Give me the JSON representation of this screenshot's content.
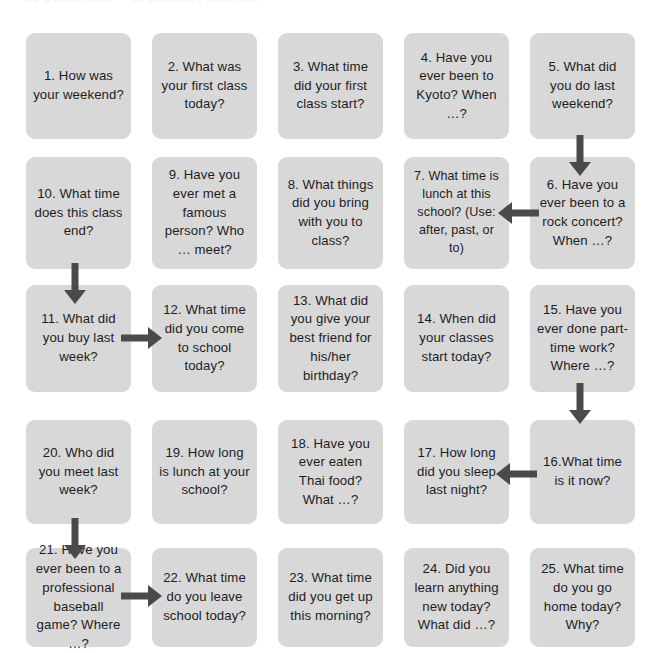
{
  "page": {
    "title_strip": "25 QUESTIONS — SPEAKING PRACTICE",
    "card_color": "#d8d8d8",
    "arrow_color": "#4a4a4a",
    "background": "#ffffff",
    "text_color": "#1d1d1f",
    "grid": {
      "columns": 5,
      "rows": 5,
      "flow": "boustrophedon"
    }
  },
  "cards": [
    {
      "n": "1",
      "text": "1. How was your weekend?"
    },
    {
      "n": "2",
      "text": "2. What was your first class today?"
    },
    {
      "n": "3",
      "text": "3. What time did your first class start?"
    },
    {
      "n": "4",
      "text": "4. Have you ever been to Kyoto? When …?"
    },
    {
      "n": "5",
      "text": "5. What did you do last weekend?"
    },
    {
      "n": "10",
      "text": "10. What time does this class end?"
    },
    {
      "n": "9",
      "text": "9. Have you ever met a famous person? Who … meet?"
    },
    {
      "n": "8",
      "text": "8. What things did you bring with you to class?"
    },
    {
      "n": "7",
      "text": "7. What time is lunch at this school? (Use: after, past, or to)"
    },
    {
      "n": "6",
      "text": "6. Have you ever been to a rock concert? When …?"
    },
    {
      "n": "11",
      "text": "11. What did you buy last week?"
    },
    {
      "n": "12",
      "text": "12. What time did you come to school today?"
    },
    {
      "n": "13",
      "text": "13. What did you give your best friend for his/her birthday?"
    },
    {
      "n": "14",
      "text": "14. When did your classes start today?"
    },
    {
      "n": "15",
      "text": "15. Have you ever done part-time work? Where …?"
    },
    {
      "n": "20",
      "text": "20. Who did you meet last week?"
    },
    {
      "n": "19",
      "text": "19. How long is lunch at your school?"
    },
    {
      "n": "18",
      "text": "18. Have you ever eaten Thai food? What …?"
    },
    {
      "n": "17",
      "text": "17. How long did you sleep last night?"
    },
    {
      "n": "16",
      "text": "16.What time is it now?"
    },
    {
      "n": "21",
      "text": "21. Have you ever been to a professional baseball game? Where …?"
    },
    {
      "n": "22",
      "text": "22. What time do you leave school today?"
    },
    {
      "n": "23",
      "text": "23. What time did you get up this morning?"
    },
    {
      "n": "24",
      "text": "24. Did you learn anything new today? What did …?"
    },
    {
      "n": "25",
      "text": "25. What time do you go home today? Why?"
    }
  ],
  "arrows": [
    {
      "name": "arrow-5-to-6",
      "direction": "down",
      "from": "5",
      "to": "6"
    },
    {
      "name": "arrow-6-to-7",
      "direction": "left",
      "from": "6",
      "to": "7"
    },
    {
      "name": "arrow-10-to-11",
      "direction": "down",
      "from": "10",
      "to": "11"
    },
    {
      "name": "arrow-11-to-12",
      "direction": "right",
      "from": "11",
      "to": "12"
    },
    {
      "name": "arrow-15-to-16",
      "direction": "down",
      "from": "15",
      "to": "16"
    },
    {
      "name": "arrow-16-to-17",
      "direction": "left",
      "from": "16",
      "to": "17"
    },
    {
      "name": "arrow-20-to-21",
      "direction": "down",
      "from": "20",
      "to": "21"
    },
    {
      "name": "arrow-21-to-22",
      "direction": "right",
      "from": "21",
      "to": "22"
    }
  ]
}
